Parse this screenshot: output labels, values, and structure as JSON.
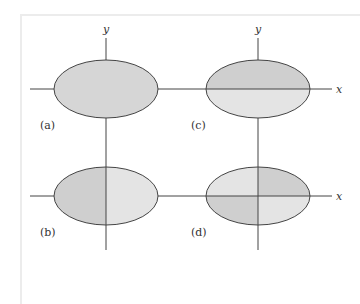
{
  "figure": {
    "colors": {
      "dark_fill": "#cfcfcf",
      "light_fill": "#e4e4e4",
      "uniform_fill": "#d6d6d6",
      "line": "#333333",
      "frame": "#ececec"
    },
    "panels": [
      {
        "id": "a",
        "label": "(a)",
        "y_axis_label": "y",
        "x_axis_label": "",
        "shading": "uniform"
      },
      {
        "id": "c",
        "label": "(c)",
        "y_axis_label": "y",
        "x_axis_label": "x",
        "shading": "top-half darker"
      },
      {
        "id": "b",
        "label": "(b)",
        "y_axis_label": "",
        "x_axis_label": "",
        "shading": "left-half darker"
      },
      {
        "id": "d",
        "label": "(d)",
        "y_axis_label": "",
        "x_axis_label": "x",
        "shading": "quadrants I and III darker"
      }
    ]
  }
}
